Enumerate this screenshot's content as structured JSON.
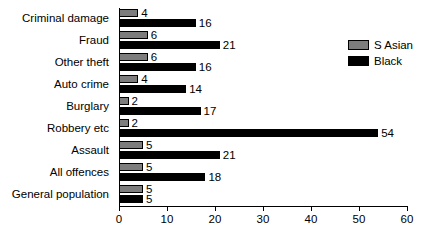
{
  "chart_data": {
    "type": "bar",
    "orientation": "horizontal",
    "title": "",
    "xlabel": "",
    "ylabel": "",
    "xlim": [
      0,
      60
    ],
    "xticks": [
      0,
      10,
      20,
      30,
      40,
      50,
      60
    ],
    "grid": false,
    "legend_position": "top-right",
    "categories": [
      "Criminal damage",
      "Fraud",
      "Other theft",
      "Auto crime",
      "Burglary",
      "Robbery etc",
      "Assault",
      "All offences",
      "General population"
    ],
    "series": [
      {
        "name": "S Asian",
        "color": "#7d7d7d",
        "values": [
          4,
          6,
          6,
          4,
          2,
          2,
          5,
          5,
          5
        ]
      },
      {
        "name": "Black",
        "color": "#000000",
        "values": [
          16,
          21,
          16,
          14,
          17,
          54,
          21,
          18,
          5
        ]
      }
    ]
  }
}
